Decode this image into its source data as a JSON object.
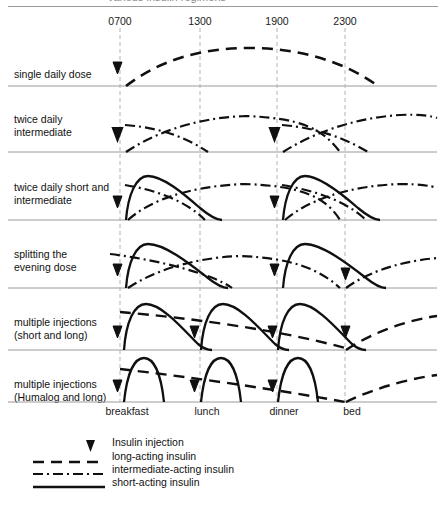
{
  "figure": {
    "title_fragment": "various insulin regimens",
    "time_axis": {
      "labels": [
        "0700",
        "1300",
        "1900",
        "2300"
      ],
      "x": [
        120,
        200,
        277,
        345
      ]
    },
    "meal_axis": {
      "labels": [
        "breakfast",
        "lunch",
        "dinner",
        "bed"
      ],
      "x": [
        127,
        207,
        284,
        352
      ]
    },
    "rows": [
      {
        "label": "single daily dose",
        "label_y": 68,
        "baseline": 86
      },
      {
        "label": "twice daily\nintermediate",
        "label_y": 113,
        "baseline": 152
      },
      {
        "label": "twice daily short and\nintermediate",
        "label_y": 181,
        "baseline": 220
      },
      {
        "label": "splitting the\nevening dose",
        "label_y": 248,
        "baseline": 288
      },
      {
        "label": "multiple injections\n(short and long)",
        "label_y": 316,
        "baseline": 350
      },
      {
        "label": "multiple injections\n(Humalog and long)",
        "label_y": 378,
        "baseline": 402
      }
    ],
    "legend": {
      "items": [
        {
          "label": "Insulin injection",
          "style": "marker"
        },
        {
          "label": "long-acting insulin",
          "style": "long-dash"
        },
        {
          "label": "intermediate-acting insulin",
          "style": "dash-dot"
        },
        {
          "label": "short-acting insulin",
          "style": "solid"
        }
      ]
    },
    "colors": {
      "curve": "#101010",
      "baseline": "#9a9a9a",
      "gridline": "#b5b5b5",
      "text": "#111111"
    }
  }
}
